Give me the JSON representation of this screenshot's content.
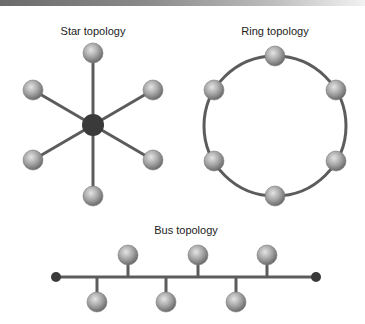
{
  "diagrams": {
    "star": {
      "title": "Star topology",
      "hub": {
        "x": 93,
        "y": 125,
        "color": "#3a3a3a"
      },
      "nodes": [
        {
          "x": 93,
          "y": 53
        },
        {
          "x": 153,
          "y": 90
        },
        {
          "x": 153,
          "y": 160
        },
        {
          "x": 93,
          "y": 196
        },
        {
          "x": 33,
          "y": 160
        },
        {
          "x": 33,
          "y": 90
        }
      ]
    },
    "ring": {
      "title": "Ring topology",
      "center": {
        "x": 275,
        "y": 126
      },
      "radius_x": 71,
      "radius_y": 70,
      "nodes": [
        {
          "x": 275,
          "y": 56
        },
        {
          "x": 336,
          "y": 90
        },
        {
          "x": 336,
          "y": 161
        },
        {
          "x": 275,
          "y": 196
        },
        {
          "x": 214,
          "y": 161
        },
        {
          "x": 214,
          "y": 90
        }
      ]
    },
    "bus": {
      "title": "Bus topology",
      "line": {
        "x1": 56,
        "x2": 316,
        "y": 277
      },
      "terminators": [
        {
          "x": 56
        },
        {
          "x": 316
        }
      ],
      "nodes_above": [
        {
          "x": 128,
          "y": 255
        },
        {
          "x": 198,
          "y": 255
        },
        {
          "x": 267,
          "y": 255
        }
      ],
      "nodes_below": [
        {
          "x": 97,
          "y": 302
        },
        {
          "x": 166,
          "y": 302
        },
        {
          "x": 236,
          "y": 302
        }
      ]
    }
  },
  "colors": {
    "line": "#5c5c5c",
    "node_light": "#d6d6d6",
    "node_dark": "#6e6e6e",
    "title_text": "#222222"
  }
}
